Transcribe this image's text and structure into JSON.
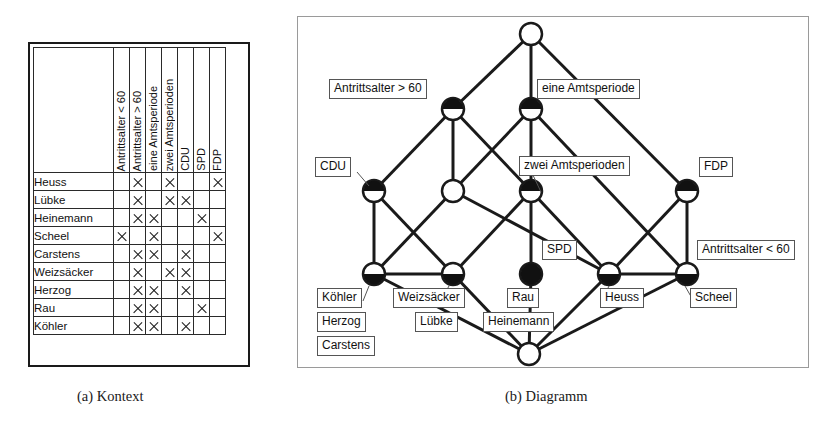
{
  "figure_a": {
    "caption": "(a) Kontext",
    "table": {
      "corner_label": "",
      "attributes": [
        "Antrittsalter < 60",
        "Antrittsalter > 60",
        "eine Amtsperiode",
        "zwei Amtsperioden",
        "CDU",
        "SPD",
        "FDP"
      ],
      "objects": [
        "Heuss",
        "Lübke",
        "Heinemann",
        "Scheel",
        "Carstens",
        "Weizsäcker",
        "Herzog",
        "Rau",
        "Köhler"
      ],
      "mark": "X",
      "incidence": [
        [
          0,
          1,
          0,
          1,
          0,
          0,
          1
        ],
        [
          0,
          1,
          0,
          1,
          1,
          0,
          0
        ],
        [
          0,
          1,
          1,
          0,
          0,
          1,
          0
        ],
        [
          1,
          0,
          1,
          0,
          0,
          0,
          1
        ],
        [
          0,
          1,
          1,
          0,
          1,
          0,
          0
        ],
        [
          0,
          1,
          0,
          1,
          1,
          0,
          0
        ],
        [
          0,
          1,
          1,
          0,
          1,
          0,
          0
        ],
        [
          0,
          1,
          1,
          0,
          0,
          1,
          0
        ],
        [
          0,
          1,
          1,
          0,
          1,
          0,
          0
        ]
      ]
    }
  },
  "figure_b": {
    "caption": "(b) Diagramm",
    "diagram": {
      "nodes": [
        {
          "id": "top",
          "x": 234,
          "y": 18,
          "fill": "none"
        },
        {
          "id": "a60p",
          "x": 156,
          "y": 93,
          "fill": "top"
        },
        {
          "id": "eine",
          "x": 234,
          "y": 93,
          "fill": "top"
        },
        {
          "id": "cdu",
          "x": 77,
          "y": 175,
          "fill": "top"
        },
        {
          "id": "mid1",
          "x": 156,
          "y": 175,
          "fill": "none"
        },
        {
          "id": "zwei",
          "x": 234,
          "y": 175,
          "fill": "top"
        },
        {
          "id": "fdp",
          "x": 390,
          "y": 175,
          "fill": "top"
        },
        {
          "id": "koehl",
          "x": 77,
          "y": 258,
          "fill": "bottom"
        },
        {
          "id": "weizs",
          "x": 156,
          "y": 258,
          "fill": "bottom"
        },
        {
          "id": "rau",
          "x": 234,
          "y": 258,
          "fill": "full"
        },
        {
          "id": "heuss",
          "x": 312,
          "y": 258,
          "fill": "bottom"
        },
        {
          "id": "scheel",
          "x": 390,
          "y": 258,
          "fill": "bottom"
        },
        {
          "id": "bot",
          "x": 232,
          "y": 338,
          "fill": "none"
        }
      ],
      "edges": [
        [
          "top",
          "a60p"
        ],
        [
          "top",
          "eine"
        ],
        [
          "top",
          "fdp"
        ],
        [
          "a60p",
          "cdu"
        ],
        [
          "a60p",
          "mid1"
        ],
        [
          "a60p",
          "zwei"
        ],
        [
          "eine",
          "mid1"
        ],
        [
          "eine",
          "zwei"
        ],
        [
          "eine",
          "scheel"
        ],
        [
          "cdu",
          "koehl"
        ],
        [
          "cdu",
          "weizs"
        ],
        [
          "mid1",
          "koehl"
        ],
        [
          "mid1",
          "heuss"
        ],
        [
          "zwei",
          "weizs"
        ],
        [
          "zwei",
          "rau"
        ],
        [
          "zwei",
          "heuss"
        ],
        [
          "fdp",
          "heuss"
        ],
        [
          "fdp",
          "scheel"
        ],
        [
          "koehl",
          "weizs"
        ],
        [
          "weizs",
          "bot"
        ],
        [
          "rau",
          "bot"
        ],
        [
          "heuss",
          "bot"
        ],
        [
          "scheel",
          "heuss"
        ],
        [
          "scheel",
          "bot"
        ],
        [
          "koehl",
          "bot"
        ]
      ],
      "attribute_labels": [
        {
          "text": "Antrittsalter > 60",
          "x": 32,
          "y": 63,
          "leader": null
        },
        {
          "text": "eine Amtsperiode",
          "x": 240,
          "y": 63,
          "leader": null
        },
        {
          "text": "zwei Amtsperioden",
          "x": 222,
          "y": 140,
          "leader": [
            234,
            155,
            244,
            176
          ]
        },
        {
          "text": "CDU",
          "x": 18,
          "y": 141,
          "leader": [
            60,
            156,
            72,
            170
          ]
        },
        {
          "text": "FDP",
          "x": 402,
          "y": 141,
          "leader": null
        },
        {
          "text": "SPD",
          "x": 245,
          "y": 224,
          "leader": null
        },
        {
          "text": "Antrittsalter < 60",
          "x": 400,
          "y": 224,
          "leader": null
        }
      ],
      "object_labels": [
        {
          "text": "Köhler",
          "x": 20,
          "y": 272,
          "leader": [
            72,
            270,
            66,
            285
          ]
        },
        {
          "text": "Herzog",
          "x": 20,
          "y": 296,
          "leader": null
        },
        {
          "text": "Carstens",
          "x": 20,
          "y": 320,
          "leader": null
        },
        {
          "text": "Weizsäcker",
          "x": 96,
          "y": 272,
          "leader": [
            152,
            270,
            144,
            284
          ]
        },
        {
          "text": "Lübke",
          "x": 118,
          "y": 296,
          "leader": null
        },
        {
          "text": "Rau",
          "x": 210,
          "y": 272,
          "leader": null
        },
        {
          "text": "Heinemann",
          "x": 186,
          "y": 296,
          "leader": null
        },
        {
          "text": "Heuss",
          "x": 303,
          "y": 272,
          "leader": [
            312,
            270,
            305,
            284
          ]
        },
        {
          "text": "Scheel",
          "x": 393,
          "y": 272,
          "leader": [
            388,
            270,
            396,
            284
          ]
        }
      ]
    }
  }
}
